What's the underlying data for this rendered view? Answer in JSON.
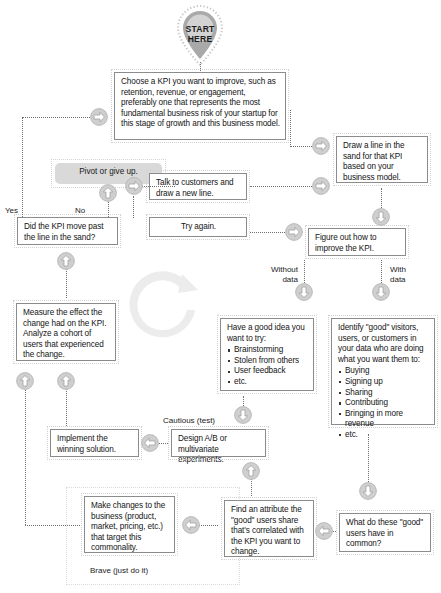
{
  "diagram": {
    "start": {
      "line1": "START",
      "line2": "HERE"
    },
    "nodes": {
      "choose_kpi": "Choose a KPI you want to improve, such as retention, revenue, or engagement, preferably one that represents the most fundamental business risk of your startup for this stage of growth and this business model.",
      "draw_line": "Draw a line in the sand for that KPI based on your business model.",
      "pivot": "Pivot or give up.",
      "talk_customers": "Talk to customers and draw a new line.",
      "try_again": "Try again.",
      "did_kpi_move": "Did the KPI move past the line in the sand?",
      "figure_out": "Figure out how to improve the KPI.",
      "measure_effect": "Measure the effect the change had on the KPI. Analyze a cohort of users that experienced the change.",
      "good_idea_heading": "Have a good idea you want to try:",
      "good_idea_items": [
        "Brainstorming",
        "Stolen from others",
        "User feedback",
        "etc."
      ],
      "identify_good_heading": "Identify \"good\" visitors, users, or customers in your data who are doing what you want them to:",
      "identify_good_items": [
        "Buying",
        "Signing up",
        "Sharing",
        "Contributing",
        "Bringing in more revenue",
        "etc."
      ],
      "implement": "Implement the winning solution.",
      "design_ab": "Design A/B or multivariate experiments.",
      "make_changes": "Make changes to the business (product, market, pricing, etc.) that target this commonality.",
      "find_attribute": "Find an attribute the \"good\" users share that's correlated with the KPI you want to change.",
      "what_common": "What do these \"good\" users have in common?"
    },
    "edge_labels": {
      "yes": "Yes",
      "no": "No",
      "without_data": "Without\ndata",
      "with_data": "With\ndata",
      "cautious": "Cautious (test)",
      "brave": "Brave (just do it)"
    },
    "colors": {
      "box_border": "#8c8c8c",
      "pill_fill": "#d9d9d9",
      "arrow_fill": "#c9c9c9",
      "arrow_stroke": "#9e9e9e",
      "connector": "#6f6f6f",
      "text": "#141414",
      "watermark": "#ececec",
      "badge": "#a8a8a8"
    }
  }
}
